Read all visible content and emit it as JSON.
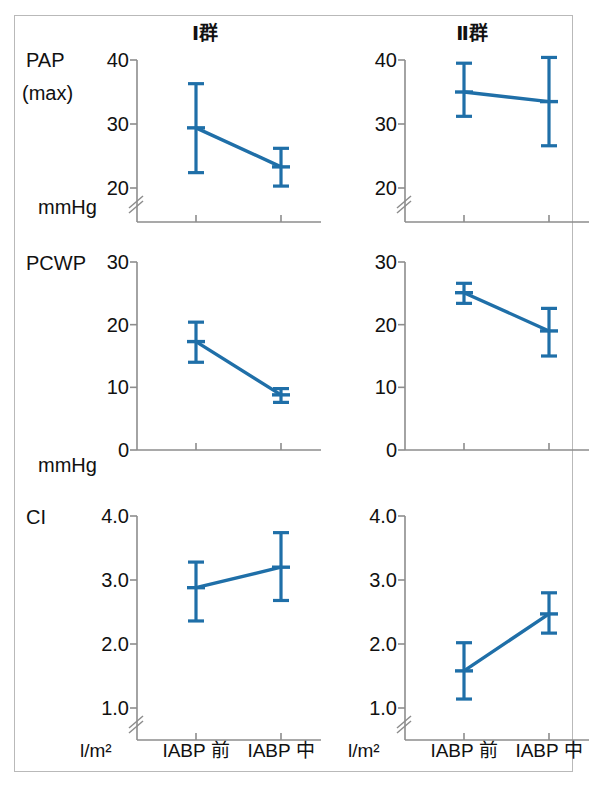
{
  "figure": {
    "panel_titles": [
      "Ⅰ群",
      "Ⅱ群"
    ],
    "accent_color": "#1F6FA8",
    "axis_color": "#8D8D8D",
    "frame_color": "#B9B9B9",
    "categories": [
      "IABP 前",
      "IABP 中"
    ],
    "x_unit_labels": [
      "l/m²",
      "l/m²"
    ],
    "row_labels": [
      "PAP",
      "(max)",
      "PCWP",
      "CI"
    ],
    "row_units": [
      "mmHg",
      "mmHg",
      ""
    ]
  },
  "chart_data": [
    {
      "type": "line",
      "title": "PAP (max) — Ⅰ群",
      "series_name": "Ⅰ群",
      "categories": [
        "IABP 前",
        "IABP 中"
      ],
      "x": [
        "IABP 前",
        "IABP 中"
      ],
      "values": [
        29.4,
        23.3
      ],
      "error_low": [
        22.4,
        20.3
      ],
      "error_high": [
        36.3,
        26.2
      ],
      "ylabel": "PAP (max)",
      "yunit": "mmHg",
      "xlabel": "",
      "yticks": [
        20,
        30,
        40
      ],
      "ytick_labels": [
        "20",
        "30",
        "40"
      ],
      "ylim": [
        20,
        40
      ],
      "axis_break": true,
      "grid": false,
      "legend": "none"
    },
    {
      "type": "line",
      "title": "PAP (max) — Ⅱ群",
      "series_name": "Ⅱ群",
      "categories": [
        "IABP 前",
        "IABP 中"
      ],
      "x": [
        "IABP 前",
        "IABP 中"
      ],
      "values": [
        35.0,
        33.5
      ],
      "error_low": [
        31.2,
        26.6
      ],
      "error_high": [
        39.5,
        40.4
      ],
      "ylabel": "PAP (max)",
      "yunit": "mmHg",
      "xlabel": "",
      "yticks": [
        20,
        30,
        40
      ],
      "ytick_labels": [
        "20",
        "30",
        "40"
      ],
      "ylim": [
        20,
        40
      ],
      "axis_break": true,
      "grid": false,
      "legend": "none"
    },
    {
      "type": "line",
      "title": "PCWP — Ⅰ群",
      "series_name": "Ⅰ群",
      "categories": [
        "IABP 前",
        "IABP 中"
      ],
      "x": [
        "IABP 前",
        "IABP 中"
      ],
      "values": [
        17.3,
        8.8
      ],
      "error_low": [
        14.0,
        7.6
      ],
      "error_high": [
        20.4,
        9.8
      ],
      "ylabel": "PCWP",
      "yunit": "mmHg",
      "xlabel": "",
      "yticks": [
        0,
        10,
        20,
        30
      ],
      "ytick_labels": [
        "0",
        "10",
        "20",
        "30"
      ],
      "ylim": [
        0,
        30
      ],
      "axis_break": false,
      "grid": false,
      "legend": "none"
    },
    {
      "type": "line",
      "title": "PCWP — Ⅱ群",
      "series_name": "Ⅱ群",
      "categories": [
        "IABP 前",
        "IABP 中"
      ],
      "x": [
        "IABP 前",
        "IABP 中"
      ],
      "values": [
        25.1,
        19.0
      ],
      "error_low": [
        23.4,
        15.0
      ],
      "error_high": [
        26.6,
        22.6
      ],
      "ylabel": "PCWP",
      "yunit": "mmHg",
      "xlabel": "",
      "yticks": [
        0,
        10,
        20,
        30
      ],
      "ytick_labels": [
        "0",
        "10",
        "20",
        "30"
      ],
      "ylim": [
        0,
        30
      ],
      "axis_break": false,
      "grid": false,
      "legend": "none"
    },
    {
      "type": "line",
      "title": "CI — Ⅰ群",
      "series_name": "Ⅰ群",
      "categories": [
        "IABP 前",
        "IABP 中"
      ],
      "x": [
        "IABP 前",
        "IABP 中"
      ],
      "values": [
        2.88,
        3.2
      ],
      "error_low": [
        2.36,
        2.68
      ],
      "error_high": [
        3.28,
        3.74
      ],
      "ylabel": "CI",
      "yunit": "l/m²",
      "xlabel": "",
      "yticks": [
        1.0,
        2.0,
        3.0,
        4.0
      ],
      "ytick_labels": [
        "1.0",
        "2.0",
        "3.0",
        "4.0"
      ],
      "ylim": [
        1.0,
        4.0
      ],
      "axis_break": true,
      "grid": false,
      "legend": "none"
    },
    {
      "type": "line",
      "title": "CI — Ⅱ群",
      "series_name": "Ⅱ群",
      "categories": [
        "IABP 前",
        "IABP 中"
      ],
      "x": [
        "IABP 前",
        "IABP 中"
      ],
      "values": [
        1.58,
        2.47
      ],
      "error_low": [
        1.14,
        2.17
      ],
      "error_high": [
        2.02,
        2.8
      ],
      "ylabel": "CI",
      "yunit": "l/m²",
      "xlabel": "",
      "yticks": [
        1.0,
        2.0,
        3.0,
        4.0
      ],
      "ytick_labels": [
        "1.0",
        "2.0",
        "3.0",
        "4.0"
      ],
      "ylim": [
        1.0,
        4.0
      ],
      "axis_break": true,
      "grid": false,
      "legend": "none"
    }
  ]
}
